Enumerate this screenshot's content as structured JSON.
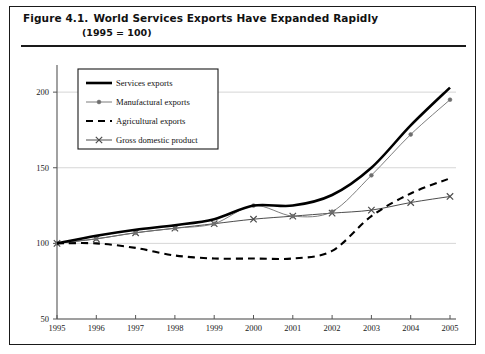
{
  "figure": {
    "label": "Figure 4.1.",
    "title": "World Services Exports Have Expanded Rapidly",
    "subtitle": "(1995 = 100)"
  },
  "colors": {
    "frame": "#1a1a1a",
    "axis": "#555555",
    "gridline": "#cccccc",
    "services": "#000000",
    "manufactural": "#6e6e6e",
    "agricultural": "#000000",
    "gdp": "#4d4d4d",
    "background": "#ffffff"
  },
  "chart_data": {
    "type": "line",
    "title": "World Services Exports Have Expanded Rapidly",
    "subtitle": "(1995 = 100)",
    "xlabel": "",
    "ylabel": "",
    "x": [
      1995,
      1996,
      1997,
      1998,
      1999,
      2000,
      2001,
      2002,
      2003,
      2004,
      2005
    ],
    "categories": [
      "1995",
      "1996",
      "1997",
      "1998",
      "1999",
      "2000",
      "2001",
      "2002",
      "2003",
      "2004",
      "2005"
    ],
    "xlim": [
      1995,
      2005
    ],
    "ylim": [
      50,
      210
    ],
    "yticks": [
      50,
      100,
      150,
      200
    ],
    "ytick_labels": [
      "50",
      "100",
      "150",
      "200"
    ],
    "grid": true,
    "grid_axis": "y",
    "legend_position": "upper left",
    "series": [
      {
        "name": "Services exports",
        "style": "solid-thick",
        "marker": "none",
        "values": [
          100,
          105,
          109,
          112,
          116,
          125,
          125,
          132,
          150,
          178,
          203
        ]
      },
      {
        "name": "Manufactural exports",
        "style": "solid-thin",
        "marker": "dot",
        "values": [
          100,
          103,
          107,
          110,
          113,
          125,
          118,
          121,
          145,
          172,
          195
        ]
      },
      {
        "name": "Agricultural exports",
        "style": "dashed",
        "marker": "none",
        "values": [
          100,
          100,
          97,
          92,
          90,
          90,
          90,
          95,
          118,
          133,
          143
        ]
      },
      {
        "name": "Gross domestic product",
        "style": "solid-thin",
        "marker": "cross",
        "values": [
          100,
          103,
          107,
          110,
          113,
          116,
          118,
          120,
          122,
          127,
          131
        ]
      }
    ]
  }
}
